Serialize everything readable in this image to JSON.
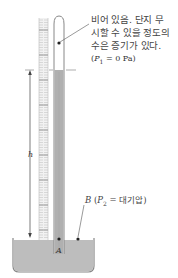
{
  "figure": {
    "type": "mercury barometer diagram",
    "annotations": {
      "vacuum_line1": "비어 있음. 단지 무",
      "vacuum_line2": "시할 수 있을 정도의",
      "vacuum_line3": "수은 증기가 있다.",
      "p1_var": "P",
      "p1_sub": "1",
      "p1_rest": " = 0 Pa)",
      "p1_open": "(",
      "point_b": "B",
      "p2_open": " (",
      "p2_var": "P",
      "p2_sub": "2",
      "p2_rest": " = 대기압)",
      "height_label": "h",
      "point_a": "A"
    },
    "colors": {
      "mercury": "#b8b8b8",
      "mercury_dark": "#9e9e9e",
      "glass_outline": "#888888",
      "scale": "#d9d9d9",
      "line": "#555555"
    }
  }
}
